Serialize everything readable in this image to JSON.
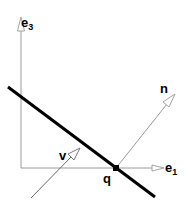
{
  "diagram": {
    "axes": {
      "vertical_label": "e",
      "vertical_subscript": "3",
      "horizontal_label": "e",
      "horizontal_subscript": "1"
    },
    "vectors": {
      "normal_label": "n",
      "direction_label": "v"
    },
    "point_label": "q",
    "colors": {
      "axis": "#999999",
      "line": "#000000",
      "arrow_fill": "#ffffff",
      "point": "#000000"
    }
  }
}
